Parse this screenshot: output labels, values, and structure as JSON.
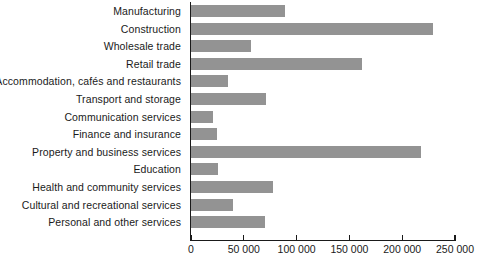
{
  "chart_data": {
    "type": "bar",
    "orientation": "horizontal",
    "title": "",
    "xlabel": "",
    "ylabel": "",
    "xlim": [
      0,
      250000
    ],
    "grid": false,
    "legend": false,
    "bar_color": "#939393",
    "axis_color": "#1a1a1a",
    "xticks": [
      0,
      50000,
      100000,
      150000,
      200000,
      250000
    ],
    "xtick_labels": [
      "0",
      "50 000",
      "100 000",
      "150 000",
      "200 000",
      "250 000"
    ],
    "categories": [
      "Manufacturing",
      "Construction",
      "Wholesale trade",
      "Retail trade",
      "Accommodation, cafés and restaurants",
      "Transport and storage",
      "Communication services",
      "Finance and insurance",
      "Property and business services",
      "Education",
      "Health and community services",
      "Cultural and recreational services",
      "Personal and other services"
    ],
    "values": [
      89000,
      229000,
      57000,
      162000,
      35000,
      71000,
      21000,
      25000,
      218000,
      26000,
      78000,
      40000,
      70000
    ]
  }
}
